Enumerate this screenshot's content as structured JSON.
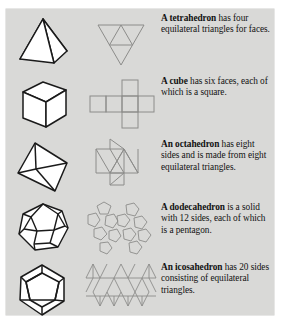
{
  "figure": {
    "background_color": "#d9d9d7",
    "page_color": "#ffffff",
    "solid_stroke": "#1a1a1a",
    "solid_fill": "#ffffff",
    "net_stroke": "#8a8a88",
    "text_color": "#111111"
  },
  "rows": [
    {
      "name": "tetrahedron",
      "solid_icon": "tetrahedron-solid",
      "net_icon": "tetrahedron-net",
      "term": "A tetrahedron",
      "description": " has four equilateral triangles for faces."
    },
    {
      "name": "cube",
      "solid_icon": "cube-solid",
      "net_icon": "cube-net",
      "term": "A cube",
      "description": " has six faces, each of which is a square."
    },
    {
      "name": "octahedron",
      "solid_icon": "octahedron-solid",
      "net_icon": "octahedron-net",
      "term": "An octahedron",
      "description": " has eight sides and is made from eight equilateral triangles."
    },
    {
      "name": "dodecahedron",
      "solid_icon": "dodecahedron-solid",
      "net_icon": "dodecahedron-net",
      "term": "A dodecahedron",
      "description": " is a solid with 12 sides, each of which is a pentagon."
    },
    {
      "name": "icosahedron",
      "solid_icon": "icosahedron-solid",
      "net_icon": "icosahedron-net",
      "term": "An icosahedron",
      "description": " has 20 sides consisting of equilateral triangles."
    }
  ]
}
